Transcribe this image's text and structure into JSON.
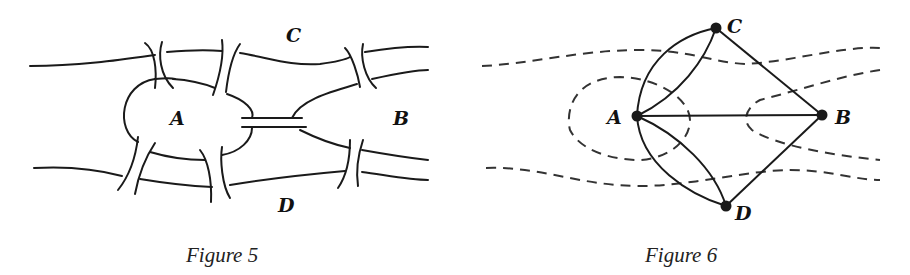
{
  "figure5": {
    "caption": "Figure 5",
    "labels": {
      "A": "A",
      "B": "B",
      "C": "C",
      "D": "D"
    },
    "description": "Königsberg river map: island A, landmass B to the east, north bank C, south bank D, with seven bridges"
  },
  "figure6": {
    "caption": "Figure 6",
    "labels": {
      "A": "A",
      "B": "B",
      "C": "C",
      "D": "D"
    },
    "nodes": [
      "A",
      "B",
      "C",
      "D"
    ],
    "edges": [
      [
        "A",
        "C"
      ],
      [
        "A",
        "C"
      ],
      [
        "A",
        "D"
      ],
      [
        "A",
        "D"
      ],
      [
        "A",
        "B"
      ],
      [
        "C",
        "B"
      ],
      [
        "D",
        "B"
      ]
    ],
    "description": "Graph representation of the seven bridges, overlaid on dashed river outline"
  }
}
